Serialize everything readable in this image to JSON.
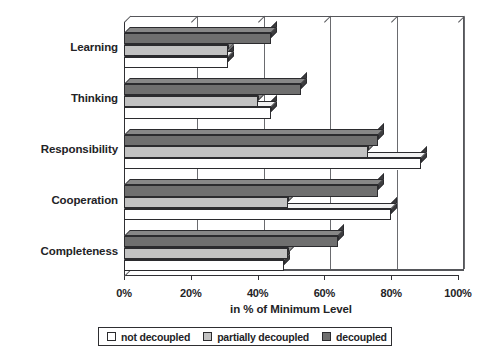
{
  "chart_data": {
    "type": "bar",
    "orientation": "horizontal",
    "title": "",
    "xlabel": "in % of Minimum Level",
    "ylabel": "",
    "xlim": [
      0,
      100
    ],
    "xticks": [
      "0%",
      "20%",
      "40%",
      "60%",
      "80%",
      "100%"
    ],
    "xtick_values": [
      0,
      20,
      40,
      60,
      80,
      100
    ],
    "grid": true,
    "legend_position": "bottom",
    "categories": [
      "Learning",
      "Thinking",
      "Responsibility",
      "Cooperation",
      "Completeness"
    ],
    "series": [
      {
        "name": "not decoupled",
        "color": "#ffffff",
        "values": [
          31,
          44,
          89,
          80,
          48
        ],
        "labels": [
          "31%",
          "44%",
          "89%",
          "80%",
          "48%"
        ]
      },
      {
        "name": "partially decoupled",
        "color": "#c2c2c2",
        "values": [
          31,
          40,
          73,
          49,
          49
        ],
        "labels": [
          "31%",
          "40%",
          "73%",
          "49%",
          "49%"
        ]
      },
      {
        "name": "decoupled",
        "color": "#6f6f6f",
        "values": [
          44,
          53,
          76,
          76,
          64
        ],
        "labels": [
          "44%",
          "53%",
          "76%",
          "76%",
          "64%"
        ]
      }
    ]
  },
  "axis": {
    "x_title": "in % of Minimum Level",
    "ticks": [
      {
        "label": "0%",
        "value": 0
      },
      {
        "label": "20%",
        "value": 20
      },
      {
        "label": "40%",
        "value": 40
      },
      {
        "label": "60%",
        "value": 60
      },
      {
        "label": "80%",
        "value": 80
      },
      {
        "label": "100%",
        "value": 100
      }
    ]
  },
  "categories": [
    {
      "label": "Learning"
    },
    {
      "label": "Thinking"
    },
    {
      "label": "Responsibility"
    },
    {
      "label": "Cooperation"
    },
    {
      "label": "Completeness"
    }
  ],
  "legend": {
    "items": [
      {
        "label": "not decoupled",
        "swatch": "white-square-icon",
        "color": "#ffffff"
      },
      {
        "label": "partially decoupled",
        "swatch": "light-gray-square-icon",
        "color": "#c2c2c2"
      },
      {
        "label": "decoupled",
        "swatch": "dark-gray-square-icon",
        "color": "#6f6f6f"
      }
    ]
  }
}
